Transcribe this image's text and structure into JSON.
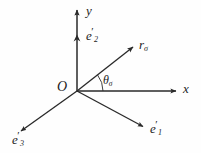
{
  "figure": {
    "type": "vector-coordinate-diagram",
    "background_color": "#fefefe",
    "stroke_color": "#2a2a2a",
    "text_color": "#1c1c1c",
    "width": 201,
    "height": 153,
    "origin": {
      "x": 77,
      "y": 91
    }
  },
  "labels": {
    "y_axis": "y",
    "x_axis": "x",
    "origin": "O",
    "e2": {
      "base": "e",
      "prime": "′",
      "sub": "2"
    },
    "e1": {
      "base": "e",
      "prime": "′",
      "sub": "1"
    },
    "e3": {
      "base": "e",
      "prime": "′",
      "sub": "3"
    },
    "r_sigma": {
      "base": "r",
      "sub": "σ"
    },
    "theta_sigma": {
      "base": "θ",
      "sub": "σ"
    }
  },
  "elements": {
    "y_axis": {
      "name": "y-axis",
      "from": [
        77,
        91
      ],
      "to": [
        77,
        8
      ],
      "arrow": "up"
    },
    "x_axis": {
      "name": "x-axis",
      "from": [
        77,
        91
      ],
      "to": [
        178,
        91
      ],
      "arrow": "right"
    },
    "e2_marker": {
      "name": "e2-arrowhead",
      "at": [
        77,
        36
      ],
      "direction": "up"
    },
    "r_sigma_vector": {
      "name": "r-sigma-vector",
      "from": [
        77,
        91
      ],
      "to": [
        135,
        45
      ],
      "arrow": "up-right"
    },
    "e1_vector": {
      "name": "e1-vector",
      "from": [
        77,
        91
      ],
      "to": [
        145,
        128
      ],
      "arrow": "down-right"
    },
    "e3_vector": {
      "name": "e3-vector",
      "from": [
        77,
        91
      ],
      "to": [
        19,
        133
      ],
      "arrow": "down-left"
    },
    "angle_arc": {
      "name": "theta-sigma-arc",
      "center": [
        77,
        91
      ],
      "radius": 26,
      "start_deg": 0,
      "end_deg": 38
    }
  }
}
